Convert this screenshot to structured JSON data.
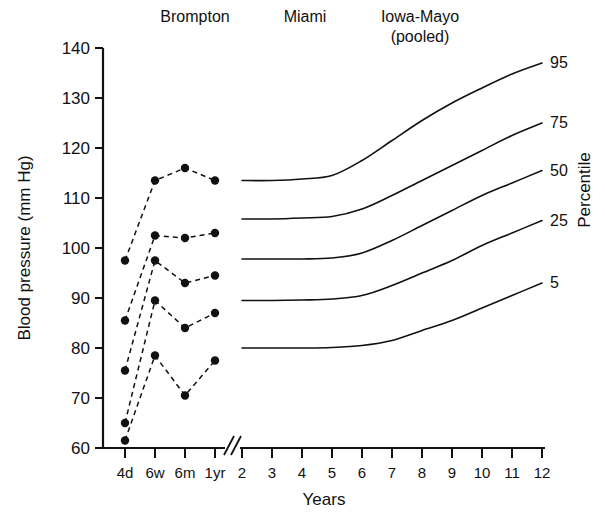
{
  "figure": {
    "headers": [
      {
        "name": "brompton",
        "label": "Brompton",
        "x": 195,
        "y": 22
      },
      {
        "name": "miami",
        "label": "Miami",
        "x": 305,
        "y": 22
      },
      {
        "name": "iowa-mayo",
        "label": "Iowa-Mayo",
        "x": 420,
        "y": 22
      },
      {
        "name": "iowa-mayo-pooled",
        "label": "(pooled)",
        "x": 420,
        "y": 42
      }
    ],
    "y_axis_title": "Blood pressure (mm Hg)",
    "x_axis_title": "Years",
    "right_axis_title": "Percentile"
  },
  "chart_data": {
    "type": "line",
    "xlabel": "Years",
    "ylabel": "Blood pressure (mm Hg)",
    "right_axis_label": "Percentile",
    "ylim": [
      60,
      140
    ],
    "ytick_labels": [
      "140",
      "130",
      "120",
      "110",
      "100",
      "90",
      "80",
      "70",
      "60"
    ],
    "ytick_values": [
      140,
      130,
      120,
      110,
      100,
      90,
      80,
      70,
      60
    ],
    "xtick_labels": [
      "4d",
      "6w",
      "6m",
      "1yr",
      "2",
      "3",
      "4",
      "5",
      "6",
      "7",
      "8",
      "9",
      "10",
      "11",
      "12"
    ],
    "axis_break_after": "1yr",
    "grid": false,
    "legend_position": "right-of-curve-ends",
    "groups": [
      "Brompton",
      "Miami",
      "Iowa-Mayo (pooled)"
    ],
    "percentile_labels": [
      "95",
      "75",
      "50",
      "25",
      "5"
    ],
    "brompton": {
      "style": "dashed-with-markers",
      "categories": [
        "4d",
        "6w",
        "6m",
        "1yr"
      ],
      "series": [
        {
          "name": "95",
          "values": [
            97.5,
            113.5,
            116.0,
            113.5
          ]
        },
        {
          "name": "75",
          "values": [
            85.5,
            102.5,
            102.0,
            103.0
          ]
        },
        {
          "name": "50",
          "values": [
            75.5,
            97.5,
            93.0,
            94.5
          ]
        },
        {
          "name": "25",
          "values": [
            65.0,
            89.5,
            84.0,
            87.0
          ]
        },
        {
          "name": "5",
          "values": [
            61.5,
            78.5,
            70.5,
            77.5
          ]
        }
      ]
    },
    "miami_iowa": {
      "style": "solid-smooth",
      "x": [
        2,
        3,
        4,
        5,
        6,
        7,
        8,
        9,
        10,
        11,
        12
      ],
      "series": [
        {
          "name": "95",
          "values": [
            113.5,
            113.5,
            113.8,
            114.5,
            117.5,
            121.5,
            125.5,
            129.0,
            132.0,
            134.8,
            137.0
          ]
        },
        {
          "name": "75",
          "values": [
            105.8,
            105.8,
            106.0,
            106.3,
            107.8,
            110.5,
            113.5,
            116.5,
            119.5,
            122.5,
            125.0
          ]
        },
        {
          "name": "50",
          "values": [
            97.8,
            97.8,
            97.8,
            98.0,
            99.0,
            101.5,
            104.5,
            107.5,
            110.5,
            113.0,
            115.5
          ]
        },
        {
          "name": "25",
          "values": [
            89.5,
            89.5,
            89.6,
            89.8,
            90.5,
            92.5,
            95.0,
            97.5,
            100.5,
            103.0,
            105.5
          ]
        },
        {
          "name": "5",
          "values": [
            80.0,
            80.0,
            80.0,
            80.1,
            80.5,
            81.5,
            83.5,
            85.5,
            88.0,
            90.5,
            93.0
          ]
        }
      ]
    }
  }
}
